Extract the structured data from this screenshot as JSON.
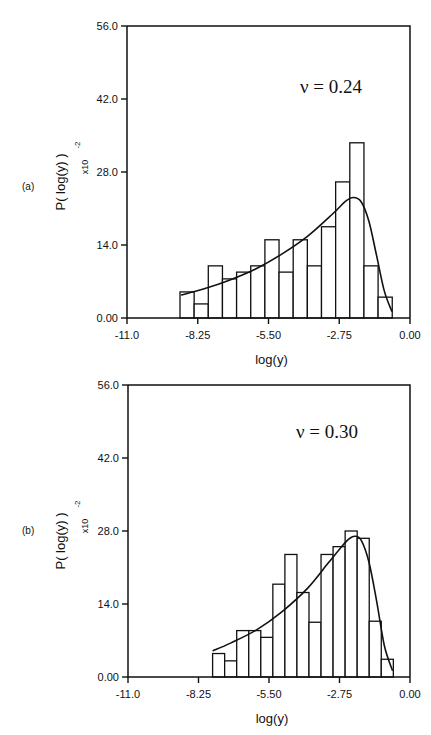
{
  "chart_data": [
    {
      "type": "bar",
      "panel_label": "(a)",
      "annotation": "ν = 0.24",
      "xlabel": "log(y)",
      "ylabel": "P( log(y) )",
      "y_scale_label": "x10",
      "y_scale_exponent": "-2",
      "xlim": [
        -11.0,
        0.0
      ],
      "ylim": [
        0.0,
        56.0
      ],
      "x_ticks": [
        "-11.0",
        "-8.25",
        "-5.50",
        "-2.75",
        "0.00"
      ],
      "x_tick_values": [
        -11.0,
        -8.25,
        -5.5,
        -2.75,
        0.0
      ],
      "y_ticks": [
        "0.00",
        "14.0",
        "28.0",
        "42.0",
        "56.0"
      ],
      "y_tick_values": [
        0,
        14,
        28,
        42,
        56
      ],
      "grid": false,
      "bin_start": -8.94,
      "bin_width": 0.55,
      "values": [
        5.0,
        2.7,
        10.0,
        7.5,
        8.8,
        10.0,
        15.0,
        8.8,
        15.0,
        10.0,
        17.5,
        26.1,
        33.6,
        10.0,
        4.0
      ],
      "fit_curve": {
        "x": [
          -8.9,
          -8.0,
          -7.0,
          -6.0,
          -5.0,
          -4.0,
          -3.0,
          -2.5,
          -2.2,
          -1.9,
          -1.6,
          -1.3,
          -1.0,
          -0.7
        ],
        "y": [
          4.4,
          5.6,
          7.3,
          9.4,
          12.2,
          15.6,
          20.0,
          22.4,
          23.1,
          22.3,
          18.6,
          12.0,
          5.2,
          1.2
        ]
      }
    },
    {
      "type": "bar",
      "panel_label": "(b)",
      "annotation": "ν = 0.30",
      "xlabel": "log(y)",
      "ylabel": "P( log(y) )",
      "y_scale_label": "x10",
      "y_scale_exponent": "-2",
      "xlim": [
        -11.0,
        0.0
      ],
      "ylim": [
        0.0,
        56.0
      ],
      "x_ticks": [
        "-11.0",
        "-8.25",
        "-5.50",
        "-2.75",
        "0.00"
      ],
      "x_tick_values": [
        -11.0,
        -8.25,
        -5.5,
        -2.75,
        0.0
      ],
      "y_ticks": [
        "0.00",
        "14.0",
        "28.0",
        "42.0",
        "56.0"
      ],
      "y_tick_values": [
        0,
        14,
        28,
        42,
        56
      ],
      "grid": false,
      "bin_start": -7.7,
      "bin_width": 0.47,
      "values": [
        4.5,
        3.1,
        8.9,
        8.9,
        7.6,
        17.8,
        23.5,
        16.2,
        10.5,
        23.5,
        25.0,
        28.0,
        26.6,
        10.7,
        3.4
      ],
      "fit_curve": {
        "x": [
          -7.7,
          -7.0,
          -6.0,
          -5.0,
          -4.0,
          -3.2,
          -2.7,
          -2.4,
          -2.15,
          -1.9,
          -1.6,
          -1.3,
          -1.0,
          -0.68
        ],
        "y": [
          5.0,
          6.5,
          9.0,
          12.5,
          17.0,
          21.8,
          24.8,
          26.4,
          27.0,
          26.2,
          22.0,
          14.5,
          6.0,
          1.2
        ]
      }
    }
  ]
}
